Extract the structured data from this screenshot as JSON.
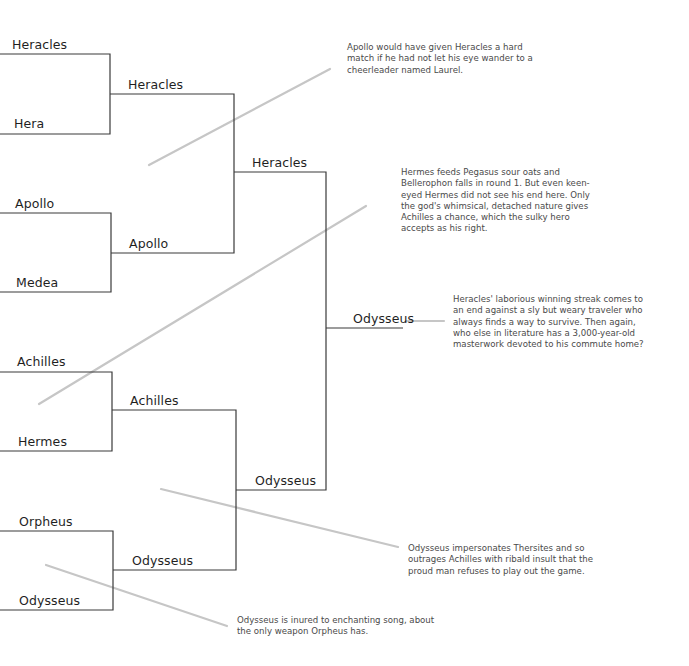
{
  "bracket": {
    "round1": [
      {
        "name": "Heracles"
      },
      {
        "name": "Hera"
      },
      {
        "name": "Apollo"
      },
      {
        "name": "Medea"
      },
      {
        "name": "Achilles"
      },
      {
        "name": "Hermes"
      },
      {
        "name": "Orpheus"
      },
      {
        "name": "Odysseus"
      }
    ],
    "round2": [
      {
        "name": "Heracles"
      },
      {
        "name": "Apollo"
      },
      {
        "name": "Achilles"
      },
      {
        "name": "Odysseus"
      }
    ],
    "round3": [
      {
        "name": "Heracles"
      },
      {
        "name": "Odysseus"
      }
    ],
    "champion": {
      "name": "Odysseus"
    }
  },
  "annotations": [
    {
      "id": "heracles-vs-apollo",
      "text": "Apollo would have given Heracles a hard match if he had not let his eye wander to a cheerleader named Laurel."
    },
    {
      "id": "achilles-vs-hermes",
      "text": "Hermes feeds Pegasus sour oats and Bellerophon falls in round 1. But even keen-eyed Hermes did not see his end here. Only the god's whimsical, detached nature gives Achilles a chance, which the sulky hero accepts as his right."
    },
    {
      "id": "final",
      "text": "Heracles' laborious winning streak comes to an end against a sly but weary traveler who always finds a way to survive. Then again, who else in literature has a 3,000-year-old masterwork devoted to his commute home?"
    },
    {
      "id": "odysseus-vs-achilles",
      "text": "Odysseus impersonates Thersites and so outrages Achilles with ribald insult that the proud man refuses to play out the game."
    },
    {
      "id": "odysseus-vs-orpheus",
      "text": "Odysseus is inured to enchanting song, about the only weapon Orpheus has."
    }
  ],
  "colors": {
    "bracket_line": "#3a3a3a",
    "callout_line": "#c4c4c4",
    "text": "#1f1f1f",
    "note_text": "#4a4a4a",
    "background": "#ffffff"
  }
}
